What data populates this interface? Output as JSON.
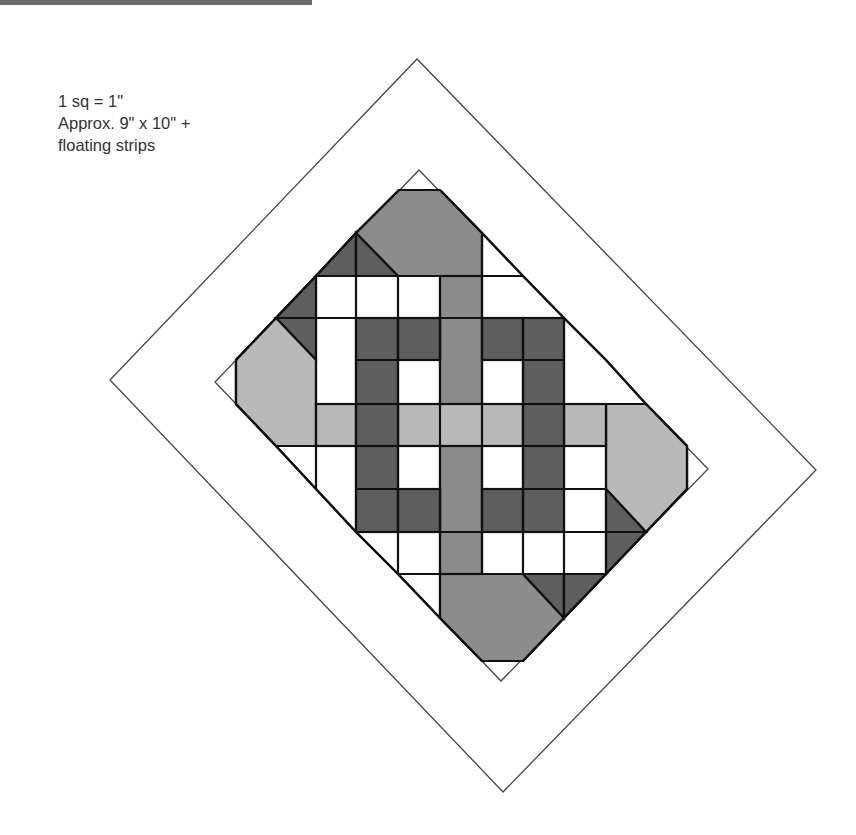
{
  "legend": {
    "scale": "1 sq = 1\"",
    "size": "Approx. 9\" x 10\" +",
    "extra": "floating strips"
  },
  "colors": {
    "white": "#ffffff",
    "light": "#b9b9b9",
    "medium": "#8c8c8c",
    "dark": "#5e5e5e",
    "line": "#111111",
    "outline": "#444444",
    "top_bar": "#6a6a6a"
  },
  "diagram": {
    "outer_diamond": [
      [
        417,
        59
      ],
      [
        816,
        470
      ],
      [
        503,
        792
      ],
      [
        110,
        380
      ]
    ],
    "inner_diamond": [
      [
        419,
        170
      ],
      [
        708,
        469
      ],
      [
        501,
        681
      ],
      [
        215,
        382
      ]
    ],
    "grid_x": [
      236,
      276,
      316,
      356,
      398,
      440,
      482,
      523,
      564,
      606,
      646,
      687
    ],
    "grid_y": [
      190,
      233,
      276,
      318,
      360,
      404,
      446,
      489,
      532,
      574,
      618,
      661
    ]
  }
}
